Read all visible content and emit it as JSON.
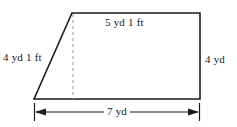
{
  "figure": {
    "name": "right-trapezoid-with-dimensions",
    "shape_type": "trapezoid",
    "background_color": "#ffffff",
    "stroke_color": "#1a1a1a",
    "dashed_color": "#9a9a9a"
  },
  "labels": {
    "top_side": "5 yd 1 ft",
    "left_side": "4 yd 1 ft",
    "right_side": "4 yd",
    "bottom_dimension": "7 yd"
  },
  "geometry": {
    "vertices": {
      "bottom_left": [
        34,
        99
      ],
      "top_left": [
        72,
        13
      ],
      "top_right": [
        200,
        13
      ],
      "bottom_right": [
        200,
        99
      ]
    },
    "height_line": {
      "x": 73,
      "y_top": 13,
      "y_bottom": 99,
      "style": "dashed"
    },
    "dimension_line": {
      "y": 112,
      "x_start": 34,
      "x_end": 200,
      "arrows": "both",
      "tick_marks": "both"
    }
  }
}
